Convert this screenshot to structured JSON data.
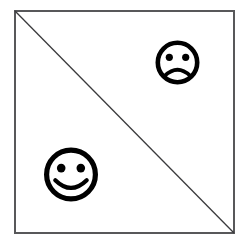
{
  "figure": {
    "title": "Square divided by a diagonal with two face icons",
    "background_color": "#ffffff",
    "canvas": {
      "width": 246,
      "height": 244
    }
  },
  "square": {
    "name": "square outline",
    "stroke_color": "#58585a",
    "fill_color": "#ffffff",
    "stroke_width": 2,
    "left": 15,
    "top": 11,
    "right": 234,
    "bottom": 233
  },
  "diagonal": {
    "name": "diagonal line",
    "stroke_color": "#3a3a3c",
    "stroke_width": 1.3,
    "from": {
      "x": 15,
      "y": 11
    },
    "to": {
      "x": 234,
      "y": 233
    },
    "description": "top-left corner to bottom-right corner"
  },
  "faces": [
    {
      "id": "sad-face",
      "label": "sad face",
      "expression": "frown",
      "region": "upper-right triangle",
      "stroke_color": "#000000",
      "fill_color": "#ffffff",
      "center": {
        "x": 177.5,
        "y": 62.5
      },
      "radius": 22,
      "ring_width": 4.6,
      "eye_radius": 3.6,
      "eye_offset_x": 8.2,
      "eye_offset_y": -5.2,
      "mouth_width": 3.6,
      "mouth_curve": "concave-up"
    },
    {
      "id": "smiley-face",
      "label": "smiley face",
      "expression": "smile",
      "region": "lower-left triangle",
      "stroke_color": "#000000",
      "fill_color": "#ffffff",
      "center": {
        "x": 71,
        "y": 174.5
      },
      "radius": 27,
      "ring_width": 5.2,
      "eye_radius": 4.3,
      "eye_offset_x": 9.8,
      "eye_offset_y": -6.4,
      "mouth_width": 4.2,
      "mouth_curve": "concave-down"
    }
  ]
}
